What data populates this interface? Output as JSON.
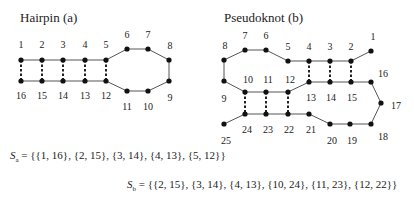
{
  "diagrams": [
    {
      "id": "hairpin",
      "title": "Hairpin (a)",
      "title_pos": [
        20,
        22
      ],
      "nodes": [
        {
          "n": "1",
          "x": 21,
          "y": 60,
          "lx": 21,
          "ly": 48
        },
        {
          "n": "2",
          "x": 42,
          "y": 60,
          "lx": 42,
          "ly": 48
        },
        {
          "n": "3",
          "x": 63,
          "y": 60,
          "lx": 63,
          "ly": 48
        },
        {
          "n": "4",
          "x": 85,
          "y": 60,
          "lx": 85,
          "ly": 48
        },
        {
          "n": "5",
          "x": 106,
          "y": 60,
          "lx": 106,
          "ly": 48
        },
        {
          "n": "6",
          "x": 127,
          "y": 49,
          "lx": 127,
          "ly": 38
        },
        {
          "n": "7",
          "x": 148,
          "y": 49,
          "lx": 148,
          "ly": 38
        },
        {
          "n": "8",
          "x": 169,
          "y": 60,
          "lx": 170,
          "ly": 49
        },
        {
          "n": "9",
          "x": 169,
          "y": 81,
          "lx": 170,
          "ly": 101
        },
        {
          "n": "10",
          "x": 148,
          "y": 91,
          "lx": 148,
          "ly": 110
        },
        {
          "n": "11",
          "x": 127,
          "y": 91,
          "lx": 127,
          "ly": 110
        },
        {
          "n": "12",
          "x": 106,
          "y": 81,
          "lx": 106,
          "ly": 99
        },
        {
          "n": "13",
          "x": 85,
          "y": 81,
          "lx": 85,
          "ly": 99
        },
        {
          "n": "14",
          "x": 63,
          "y": 81,
          "lx": 63,
          "ly": 99
        },
        {
          "n": "15",
          "x": 42,
          "y": 81,
          "lx": 42,
          "ly": 99
        },
        {
          "n": "16",
          "x": 21,
          "y": 81,
          "lx": 21,
          "ly": 99
        }
      ],
      "pairs": [
        [
          1,
          16
        ],
        [
          2,
          15
        ],
        [
          3,
          14
        ],
        [
          4,
          13
        ],
        [
          5,
          12
        ]
      ]
    },
    {
      "id": "pseudoknot",
      "title": "Pseudoknot (b)",
      "title_pos": [
        224,
        22
      ],
      "nodes": [
        {
          "n": "1",
          "x": 371,
          "y": 51,
          "lx": 373,
          "ly": 40
        },
        {
          "n": "2",
          "x": 351,
          "y": 61,
          "lx": 351,
          "ly": 50
        },
        {
          "n": "3",
          "x": 330,
          "y": 61,
          "lx": 330,
          "ly": 50
        },
        {
          "n": "4",
          "x": 309,
          "y": 61,
          "lx": 309,
          "ly": 50
        },
        {
          "n": "5",
          "x": 288,
          "y": 61,
          "lx": 288,
          "ly": 50
        },
        {
          "n": "6",
          "x": 266,
          "y": 50,
          "lx": 266,
          "ly": 39
        },
        {
          "n": "7",
          "x": 245,
          "y": 50,
          "lx": 245,
          "ly": 39
        },
        {
          "n": "8",
          "x": 224,
          "y": 60,
          "lx": 225,
          "ly": 49
        },
        {
          "n": "9",
          "x": 224,
          "y": 81,
          "lx": 224,
          "ly": 102
        },
        {
          "n": "10",
          "x": 245,
          "y": 92,
          "lx": 248,
          "ly": 83
        },
        {
          "n": "11",
          "x": 266,
          "y": 92,
          "lx": 268,
          "ly": 83
        },
        {
          "n": "12",
          "x": 288,
          "y": 92,
          "lx": 290,
          "ly": 83
        },
        {
          "n": "13",
          "x": 309,
          "y": 82,
          "lx": 311,
          "ly": 101
        },
        {
          "n": "14",
          "x": 330,
          "y": 82,
          "lx": 331,
          "ly": 101
        },
        {
          "n": "15",
          "x": 351,
          "y": 82,
          "lx": 352,
          "ly": 101
        },
        {
          "n": "16",
          "x": 371,
          "y": 82,
          "lx": 383,
          "ly": 77
        },
        {
          "n": "17",
          "x": 381,
          "y": 103,
          "lx": 396,
          "ly": 109
        },
        {
          "n": "18",
          "x": 371,
          "y": 124,
          "lx": 383,
          "ly": 140
        },
        {
          "n": "19",
          "x": 350,
          "y": 124,
          "lx": 352,
          "ly": 144
        },
        {
          "n": "20",
          "x": 330,
          "y": 124,
          "lx": 332,
          "ly": 144
        },
        {
          "n": "21",
          "x": 309,
          "y": 114,
          "lx": 311,
          "ly": 133
        },
        {
          "n": "22",
          "x": 288,
          "y": 114,
          "lx": 289,
          "ly": 133
        },
        {
          "n": "23",
          "x": 266,
          "y": 114,
          "lx": 268,
          "ly": 133
        },
        {
          "n": "24",
          "x": 245,
          "y": 114,
          "lx": 247,
          "ly": 133
        },
        {
          "n": "25",
          "x": 224,
          "y": 124,
          "lx": 226,
          "ly": 144
        }
      ],
      "pairs": [
        [
          2,
          15
        ],
        [
          3,
          14
        ],
        [
          4,
          13
        ],
        [
          10,
          24
        ],
        [
          11,
          23
        ],
        [
          12,
          22
        ]
      ]
    }
  ],
  "formulas": {
    "sa": {
      "symbol": "S",
      "sub": "a",
      "rhs": " = {{1, 16}, {2, 15}, {3, 14}, {4, 13}, {5, 12}}"
    },
    "sb": {
      "symbol": "S",
      "sub": "b",
      "rhs": " = {{2, 15}, {3, 14}, {4, 13}, {10, 24}, {11, 23}, {12, 22}}"
    }
  }
}
